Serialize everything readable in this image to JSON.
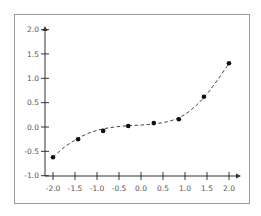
{
  "chart_data": {
    "type": "scatter",
    "title": "",
    "xlabel": "",
    "ylabel": "",
    "xlim": [
      -2.0,
      2.0
    ],
    "ylim": [
      -1.0,
      2.0
    ],
    "grid": false,
    "legend": null,
    "x_ticks": [
      "-2.0",
      "-1.5",
      "-1.0",
      "-0.5",
      "0.0",
      "0.5",
      "1.0",
      "1.5",
      "2.0"
    ],
    "y_ticks": [
      "-1.0",
      "-0.5",
      "0.0",
      "0.5",
      "1.0",
      "1.5",
      "2.0"
    ],
    "series": [
      {
        "name": "points",
        "style": "markers",
        "color": "#111111",
        "x": [
          -2.0,
          -1.43,
          -0.86,
          -0.29,
          0.29,
          0.86,
          1.43,
          2.0
        ],
        "y": [
          -0.62,
          -0.25,
          -0.08,
          0.02,
          0.08,
          0.16,
          0.62,
          1.31
        ]
      },
      {
        "name": "fit",
        "style": "dashed-line",
        "color": "#444444",
        "x": [
          -2.0,
          -1.75,
          -1.5,
          -1.25,
          -1.0,
          -0.75,
          -0.5,
          -0.25,
          0.0,
          0.25,
          0.5,
          0.75,
          1.0,
          1.25,
          1.5,
          1.75,
          2.0
        ],
        "y": [
          -0.62,
          -0.42,
          -0.27,
          -0.15,
          -0.07,
          -0.02,
          0.01,
          0.03,
          0.04,
          0.06,
          0.09,
          0.15,
          0.26,
          0.44,
          0.68,
          0.98,
          1.31
        ]
      }
    ]
  },
  "frame": {
    "border_color": "#999999"
  },
  "axes": {
    "color": "#333333",
    "label_color": "#555555"
  }
}
